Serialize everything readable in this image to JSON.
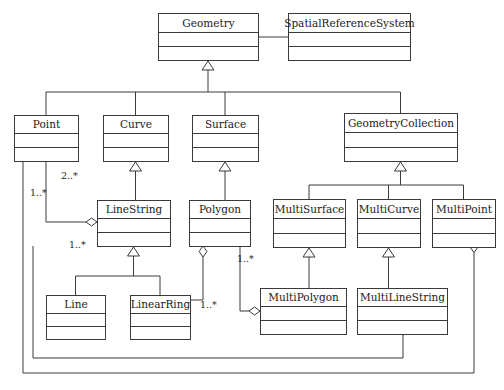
{
  "diagram": {
    "type": "uml-class-diagram",
    "width": 504,
    "height": 390,
    "background_color": "#ffffff",
    "line_color": "#3a3a3a",
    "box_fill": "#ffffff",
    "classes": [
      {
        "id": "geometry",
        "name": "Geometry",
        "x": 158,
        "y": 13,
        "w": 100,
        "h": 47
      },
      {
        "id": "srs",
        "name": "SpatialReferenceSystem",
        "x": 288,
        "y": 13,
        "w": 122,
        "h": 47
      },
      {
        "id": "point",
        "name": "Point",
        "x": 14,
        "y": 115,
        "w": 64,
        "h": 46
      },
      {
        "id": "curve",
        "name": "Curve",
        "x": 103,
        "y": 115,
        "w": 65,
        "h": 46
      },
      {
        "id": "surface",
        "name": "Surface",
        "x": 192,
        "y": 115,
        "w": 66,
        "h": 46
      },
      {
        "id": "geometrycoll",
        "name": "GeometryCollection",
        "x": 344,
        "y": 113,
        "w": 113,
        "h": 48
      },
      {
        "id": "linestring",
        "name": "LineString",
        "x": 97,
        "y": 200,
        "w": 73,
        "h": 46
      },
      {
        "id": "polygon",
        "name": "Polygon",
        "x": 189,
        "y": 200,
        "w": 61,
        "h": 46
      },
      {
        "id": "multisurface",
        "name": "MultiSurface",
        "x": 273,
        "y": 199,
        "w": 72,
        "h": 48
      },
      {
        "id": "multicurve",
        "name": "MultiCurve",
        "x": 357,
        "y": 199,
        "w": 63,
        "h": 48
      },
      {
        "id": "multipoint",
        "name": "MultiPoint",
        "x": 432,
        "y": 199,
        "w": 63,
        "h": 48
      },
      {
        "id": "line",
        "name": "Line",
        "x": 46,
        "y": 295,
        "w": 59,
        "h": 44
      },
      {
        "id": "linearring",
        "name": "LinearRing",
        "x": 130,
        "y": 295,
        "w": 60,
        "h": 44
      },
      {
        "id": "multipolygon",
        "name": "MultiPolygon",
        "x": 260,
        "y": 288,
        "w": 86,
        "h": 46
      },
      {
        "id": "multilinestring",
        "name": "MultiLineString",
        "x": 357,
        "y": 288,
        "w": 90,
        "h": 46
      }
    ],
    "generalizations": [
      {
        "id": "gen-geometry-children",
        "parent": "geometry",
        "children": [
          "point",
          "curve",
          "surface",
          "geometrycoll"
        ]
      },
      {
        "id": "gen-curve-linestring",
        "parent": "curve",
        "children": [
          "linestring"
        ]
      },
      {
        "id": "gen-surface-polygon",
        "parent": "surface",
        "children": [
          "polygon"
        ]
      },
      {
        "id": "gen-coll-multis",
        "parent": "geometrycoll",
        "children": [
          "multisurface",
          "multicurve",
          "multipoint"
        ]
      },
      {
        "id": "gen-linestring-subs",
        "parent": "linestring",
        "children": [
          "line",
          "linearring"
        ]
      },
      {
        "id": "gen-multisurface-poly",
        "parent": "multisurface",
        "children": [
          "multipolygon"
        ]
      },
      {
        "id": "gen-multicurve-mls",
        "parent": "multicurve",
        "children": [
          "multilinestring"
        ]
      }
    ],
    "associations": [
      {
        "id": "assoc-geometry-srs",
        "from": "geometry",
        "to": "srs",
        "kind": "plain"
      }
    ],
    "aggregations": [
      {
        "id": "agg-linestring-point",
        "whole": "linestring",
        "part": "point",
        "multiplicity": "2..*"
      },
      {
        "id": "agg-multipoint-point",
        "whole": "multipoint",
        "part": "point",
        "multiplicity": "1..*"
      },
      {
        "id": "agg-multilinestr-linestr",
        "whole": "multilinestring",
        "part": "linestring",
        "multiplicity": "1..*"
      },
      {
        "id": "agg-polygon-linearring",
        "whole": "polygon",
        "part": "linearring",
        "multiplicity": "1..*"
      },
      {
        "id": "agg-multipolygon-polygon",
        "whole": "multipolygon",
        "part": "polygon",
        "multiplicity": "1..*"
      }
    ],
    "multiplicity_labels": [
      {
        "id": "mult-2star-point-linestring",
        "text": "2..*",
        "x": 61,
        "y": 176
      },
      {
        "id": "mult-1star-point-multipoint",
        "text": "1..*",
        "x": 30,
        "y": 193
      },
      {
        "id": "mult-1star-linestring-mls",
        "text": "1..*",
        "x": 69,
        "y": 245
      },
      {
        "id": "mult-1star-polygon-multipoly",
        "text": "1..*",
        "x": 237,
        "y": 259
      },
      {
        "id": "mult-1star-linearring-poly",
        "text": "1..*",
        "x": 200,
        "y": 305
      }
    ]
  }
}
